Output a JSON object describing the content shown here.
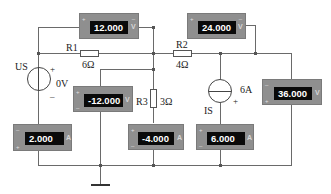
{
  "components": {
    "voltage_source": {
      "name": "US",
      "value": "0V",
      "plus": "+",
      "minus": "–"
    },
    "current_source": {
      "name": "IS",
      "value": "6A",
      "plus": "+"
    },
    "r1": {
      "name": "R1",
      "value": "6Ω"
    },
    "r2": {
      "name": "R2",
      "value": "4Ω"
    },
    "r3": {
      "name": "R3",
      "value": "3Ω"
    }
  },
  "meters": {
    "v_r1": {
      "reading": "12.000",
      "unit": "V",
      "plus": "+",
      "minus": "–"
    },
    "v_r2": {
      "reading": "24.000",
      "unit": "V",
      "plus": "+",
      "minus": "–"
    },
    "v_r3": {
      "reading": "-12.000",
      "unit": "V",
      "plus": "+",
      "minus": "–"
    },
    "v_is": {
      "reading": "36.000",
      "unit": "V",
      "plus": "+",
      "minus": "–"
    },
    "a_us": {
      "reading": "2.000",
      "unit": "A",
      "plus": "+",
      "minus": "–"
    },
    "a_r3": {
      "reading": "-4.000",
      "unit": "A",
      "plus": "+",
      "minus": "–"
    },
    "a_is": {
      "reading": "6.000",
      "unit": "A",
      "plus": "+",
      "minus": "–"
    }
  }
}
